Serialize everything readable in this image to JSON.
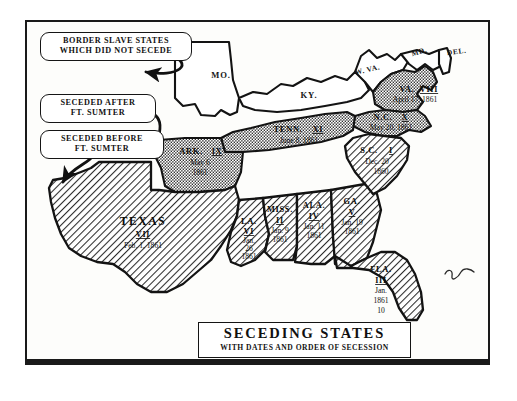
{
  "figure": {
    "title_main": "SECEDING STATES",
    "title_sub": "WITH DATES AND ORDER OF SECESSION"
  },
  "legend": {
    "border_slave": {
      "line1": "BORDER SLAVE STATES",
      "line2": "WHICH DID NOT SECEDE"
    },
    "after_sumter": {
      "line1": "SECEDED AFTER",
      "line2": "FT. SUMTER"
    },
    "before_sumter": {
      "line1": "SECEDED BEFORE",
      "line2": "FT. SUMTER"
    }
  },
  "states": {
    "seceded_before_sumter": [
      {
        "abbr": "S.C.",
        "order": "I",
        "date_line1": "Dec. 20",
        "date_line2": "1860"
      },
      {
        "abbr": "MISS.",
        "order": "II",
        "date_line1": "Jan. 9",
        "date_line2": "1861"
      },
      {
        "abbr": "FLA.",
        "order": "III",
        "date_line1": "Jan.",
        "date_line2": "10",
        "date_line3": "1861"
      },
      {
        "abbr": "ALA.",
        "order": "IV",
        "date_line1": "Jan. 11",
        "date_line2": "1861"
      },
      {
        "abbr": "GA.",
        "order": "V",
        "date_line1": "Jan. 19",
        "date_line2": "1861"
      },
      {
        "abbr": "LA.",
        "order": "VI",
        "date_line1": "Jan.",
        "date_line2": "26",
        "date_line3": "1861"
      },
      {
        "abbr": "TEXAS",
        "order": "VII",
        "date_line1": "Feb. 1, 1861",
        "date_line2": ""
      }
    ],
    "seceded_after_sumter": [
      {
        "abbr": "VA.",
        "order": "VIII",
        "date_line1": "April 17, 1861",
        "date_line2": ""
      },
      {
        "abbr": "ARK.",
        "order": "IX",
        "date_line1": "May 6",
        "date_line2": "1861"
      },
      {
        "abbr": "N.C.",
        "order": "X",
        "date_line1": "May 20, 1861",
        "date_line2": ""
      },
      {
        "abbr": "TENN.",
        "order": "XI",
        "date_line1": "June 8, 1861",
        "date_line2": ""
      }
    ],
    "border_slave_states": [
      {
        "abbr": "MO."
      },
      {
        "abbr": "KY."
      },
      {
        "abbr": "W. VA."
      },
      {
        "abbr": "MD."
      },
      {
        "abbr": "DEL."
      }
    ]
  },
  "colors": {
    "ink": "#111111",
    "paper": "#ffffff",
    "hatch_fill": "#d8d8d8",
    "stipple_fill": "#cfcfcf"
  }
}
